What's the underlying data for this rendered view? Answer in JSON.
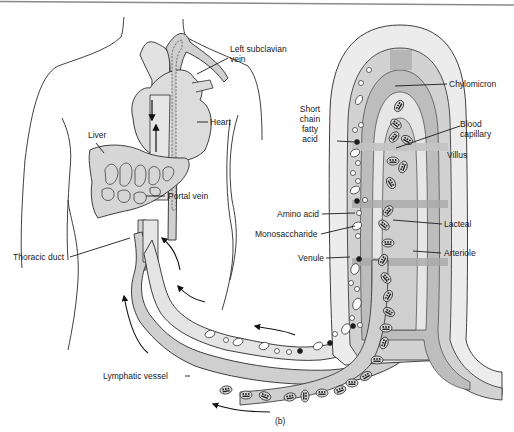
{
  "figure": {
    "panel_label": "(b)",
    "colors": {
      "background": "#ffffff",
      "outline": "#2a2a2a",
      "light_fill": "#e6e6e6",
      "mid_fill": "#cfcfcf",
      "dark_fill": "#a9a9a9",
      "villus_outer": "#ececec",
      "top_rule": "#8a8a8a"
    }
  },
  "labels": {
    "left_subclavian_vein": "Left subclavian\nvein",
    "heart": "Heart",
    "liver": "Liver",
    "portal_vein": "Portal vein",
    "thoracic_duct": "Thoracic duct",
    "lymphatic_vessel": "Lymphatic vessel",
    "chylomicron": "Chylomicron",
    "short_chain_fatty_acid": "Short\nchain\nfatty\nacid",
    "blood_capillary": "Blood\ncapillary",
    "villus": "Villus",
    "amino_acid": "Amino acid",
    "monosaccharide": "Monosaccharide",
    "lacteal": "Lacteal",
    "venule": "Venule",
    "arteriole": "Arteriole"
  },
  "flow_arrows": [
    {
      "name": "venous-return-down",
      "direction": "down"
    },
    {
      "name": "venous-return-up",
      "direction": "up"
    },
    {
      "name": "portal-flow-1",
      "direction": "up-left"
    },
    {
      "name": "portal-flow-2",
      "direction": "left"
    },
    {
      "name": "portal-flow-3",
      "direction": "left"
    },
    {
      "name": "lymph-flow-1",
      "direction": "up"
    },
    {
      "name": "lymph-flow-2",
      "direction": "left"
    }
  ]
}
